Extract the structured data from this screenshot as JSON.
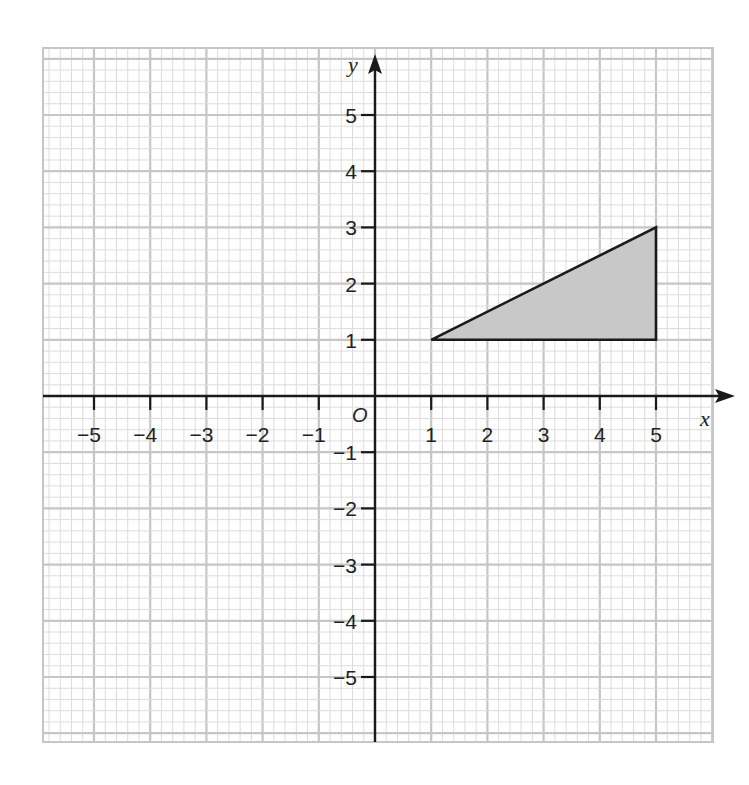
{
  "chart_data": {
    "type": "scatter",
    "title": "",
    "xlabel": "x",
    "ylabel": "y",
    "origin_label": "O",
    "xlim": [
      -5.9,
      6.0
    ],
    "ylim": [
      -6.1,
      6.2
    ],
    "grid": true,
    "grid_minor_per_unit": 5,
    "x_ticks": [
      -5,
      -4,
      -3,
      -2,
      -1,
      1,
      2,
      3,
      4,
      5
    ],
    "x_tick_labels": [
      "−5",
      "−4",
      "−3",
      "−2",
      "−1",
      "1",
      "2",
      "3",
      "4",
      "5"
    ],
    "y_ticks": [
      5,
      4,
      3,
      2,
      1,
      -1,
      -2,
      -3,
      -4,
      -5
    ],
    "y_tick_labels": [
      "5",
      "4",
      "3",
      "2",
      "1",
      "−1",
      "−2",
      "−3",
      "−4",
      "−5"
    ],
    "shapes": [
      {
        "name": "shaded-triangle",
        "type": "polygon",
        "vertices": [
          [
            1,
            1
          ],
          [
            5,
            1
          ],
          [
            5,
            3
          ]
        ],
        "fill": "#c8c8c8",
        "stroke": "#1a1a1a"
      }
    ],
    "legend": null
  },
  "colors": {
    "grid_minor": "#dcdcdc",
    "grid_major": "#c6c6c6",
    "axis": "#1a1a1a",
    "shape_fill": "#c8c8c8"
  }
}
